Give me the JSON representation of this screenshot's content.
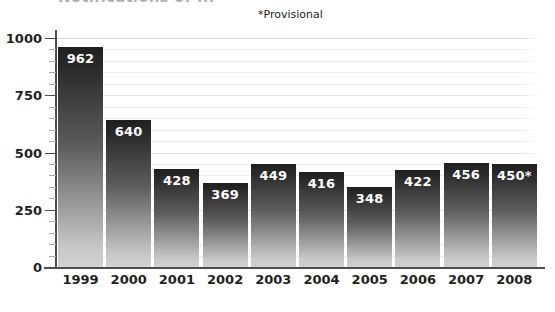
{
  "chart_data": {
    "type": "bar",
    "title": "Notifications of ...",
    "subtitle": "",
    "annotation": "*Provisional",
    "categories": [
      "1999",
      "2000",
      "2001",
      "2002",
      "2003",
      "2004",
      "2005",
      "2006",
      "2007",
      "2008"
    ],
    "values": [
      962,
      640,
      428,
      369,
      449,
      416,
      348,
      422,
      456,
      450
    ],
    "value_labels": [
      "962",
      "640",
      "428",
      "369",
      "449",
      "416",
      "348",
      "422",
      "456",
      "450*"
    ],
    "xlabel": "",
    "ylabel": "",
    "ylim": [
      0,
      1000
    ],
    "ytick_labels": [
      "0",
      "250",
      "500",
      "750",
      "1000"
    ],
    "ytick_values": [
      0,
      250,
      500,
      750,
      1000
    ],
    "minor_tick_step": 50,
    "grid": true,
    "legend": null,
    "series": [
      {
        "name": "Notifications",
        "values": [
          962,
          640,
          428,
          369,
          449,
          416,
          348,
          422,
          456,
          450
        ]
      }
    ]
  },
  "style": {
    "bar_top_color": "#1f1f20",
    "bar_bottom_color": "#d2d2d4",
    "grid_color": "#ececed",
    "axis_color": "#4d4d4f",
    "text_color": "#231f20",
    "value_label_color": "#ffffff",
    "background": "#ffffff"
  }
}
